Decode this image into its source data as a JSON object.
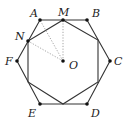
{
  "diagram": {
    "type": "geometry",
    "colors": {
      "edge": "#333333",
      "dotted": "#9a9a9a",
      "point": "#111111",
      "label": "#222222"
    },
    "points": {
      "A": {
        "label": "A",
        "x": 40,
        "y": 20
      },
      "M": {
        "label": "M",
        "x": 63,
        "y": 20
      },
      "B": {
        "label": "B",
        "x": 87,
        "y": 20
      },
      "C": {
        "label": "C",
        "x": 110,
        "y": 61
      },
      "D": {
        "label": "D",
        "x": 87,
        "y": 104
      },
      "E": {
        "label": "E",
        "x": 40,
        "y": 104
      },
      "F": {
        "label": "F",
        "x": 17,
        "y": 61
      },
      "N": {
        "label": "N",
        "x": 28,
        "y": 41
      },
      "O": {
        "label": "O",
        "x": 63,
        "y": 61
      }
    },
    "hexagon": [
      "A",
      "B",
      "C",
      "D",
      "E",
      "F"
    ],
    "octagon_vertices": [
      [
        63,
        20
      ],
      [
        98,
        40
      ],
      [
        98,
        82
      ],
      [
        63,
        104
      ],
      [
        28,
        82
      ],
      [
        28,
        41
      ]
    ],
    "dotted_segments": [
      [
        "O",
        "A"
      ],
      [
        "O",
        "M"
      ],
      [
        "O",
        "N"
      ]
    ],
    "labels": {
      "A": "A",
      "B": "B",
      "C": "C",
      "D": "D",
      "E": "E",
      "F": "F",
      "M": "M",
      "N": "N",
      "O": "O"
    }
  }
}
